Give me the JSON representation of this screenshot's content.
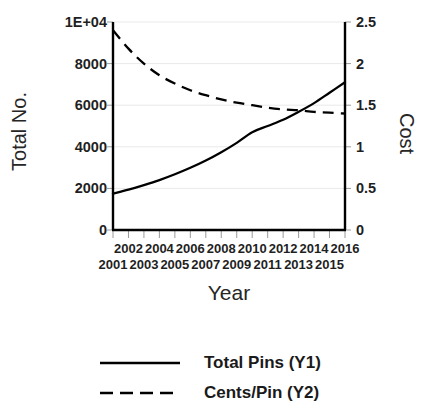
{
  "chart_data": {
    "type": "line",
    "title": "",
    "xlabel": "Year",
    "ylabel": "Total No.",
    "y2label": "Cost",
    "grid": true,
    "legend_position": "bottom",
    "xlim": [
      2001,
      2016
    ],
    "ylim": [
      0,
      10000
    ],
    "y2lim": [
      0,
      2.5
    ],
    "xticks": [
      2001,
      2002,
      2003,
      2004,
      2005,
      2006,
      2007,
      2008,
      2009,
      2010,
      2011,
      2012,
      2013,
      2014,
      2015,
      2016
    ],
    "xticklabels": [
      "2001",
      "2002",
      "2003",
      "2004",
      "2005",
      "2006",
      "2007",
      "2008",
      "2009",
      "2010",
      "2011",
      "2012",
      "2013",
      "2014",
      "2015",
      "2016"
    ],
    "xticklabels_upper": [
      "2002",
      "2004",
      "2006",
      "2008",
      "2010",
      "2012",
      "2014",
      "2016"
    ],
    "xticklabels_lower": [
      "2001",
      "2003",
      "2005",
      "2007",
      "2009",
      "2011",
      "2013",
      "2015"
    ],
    "yticks": [
      0,
      2000,
      4000,
      6000,
      8000,
      10000
    ],
    "yticklabels": [
      "0",
      "2000",
      "4000",
      "6000",
      "8000",
      "1E+04"
    ],
    "y2ticks": [
      0,
      0.5,
      1,
      1.5,
      2,
      2.5
    ],
    "y2ticklabels": [
      "0",
      "0.5",
      "1",
      "1.5",
      "2",
      "2.5"
    ],
    "x": [
      2001,
      2002,
      2003,
      2004,
      2005,
      2006,
      2007,
      2008,
      2009,
      2010,
      2011,
      2012,
      2013,
      2014,
      2015,
      2016
    ],
    "series": [
      {
        "name": "Total Pins (Y1)",
        "axis": "y1",
        "style": "solid",
        "color": "#000000",
        "values": [
          1750,
          1940,
          2160,
          2400,
          2680,
          2990,
          3340,
          3740,
          4190,
          4700,
          5000,
          5300,
          5680,
          6100,
          6600,
          7100
        ]
      },
      {
        "name": "Cents/Pin (Y2)",
        "axis": "y2",
        "style": "dashed",
        "color": "#000000",
        "values": [
          2.4,
          2.18,
          2.0,
          1.86,
          1.76,
          1.68,
          1.62,
          1.57,
          1.53,
          1.5,
          1.47,
          1.45,
          1.44,
          1.42,
          1.41,
          1.4
        ]
      }
    ],
    "legend": [
      "Total Pins (Y1)",
      "Cents/Pin (Y2)"
    ]
  },
  "colors": {
    "background": "#ffffff",
    "axis": "#000000",
    "grid": "#e8e8e8",
    "text": "#1a1a1a"
  }
}
